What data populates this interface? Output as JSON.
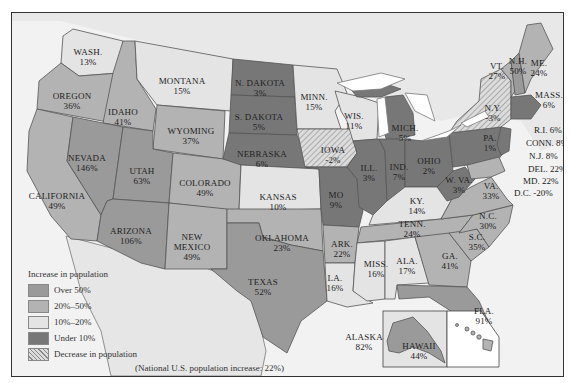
{
  "legend": {
    "title": "Increase in population",
    "items": [
      {
        "label": "Over 50%",
        "color": "#9a9a9a",
        "pattern": "solid"
      },
      {
        "label": "20%–50%",
        "color": "#b3b3b3",
        "pattern": "solid"
      },
      {
        "label": "10%–20%",
        "color": "#e4e4e4",
        "pattern": "solid"
      },
      {
        "label": "Under 10%",
        "color": "#777777",
        "pattern": "solid"
      },
      {
        "label": "Decrease in population",
        "color": "#d0d0d0",
        "pattern": "hatched"
      }
    ]
  },
  "note": "(National U.S. population increase: 22%)",
  "states": {
    "wash": {
      "name": "WASH.",
      "value": "13%"
    },
    "oregon": {
      "name": "OREGON",
      "value": "36%"
    },
    "california": {
      "name": "CALIFORNIA",
      "value": "49%"
    },
    "idaho": {
      "name": "IDAHO",
      "value": "41%"
    },
    "nevada": {
      "name": "NEVADA",
      "value": "146%"
    },
    "montana": {
      "name": "MONTANA",
      "value": "15%"
    },
    "wyoming": {
      "name": "WYOMING",
      "value": "37%"
    },
    "utah": {
      "name": "UTAH",
      "value": "63%"
    },
    "colorado": {
      "name": "COLORADO",
      "value": "49%"
    },
    "arizona": {
      "name": "ARIZONA",
      "value": "106%"
    },
    "new_mexico": {
      "name1": "NEW",
      "name2": "MEXICO",
      "value": "49%"
    },
    "n_dakota": {
      "name": "N. DAKOTA",
      "value": "3%"
    },
    "s_dakota": {
      "name": "S. DAKOTA",
      "value": "5%"
    },
    "nebraska": {
      "name": "NEBRASKA",
      "value": "6%"
    },
    "kansas": {
      "name": "KANSAS",
      "value": "10%"
    },
    "oklahoma": {
      "name": "OKLAHOMA",
      "value": "23%"
    },
    "texas": {
      "name": "TEXAS",
      "value": "52%"
    },
    "minn": {
      "name": "MINN.",
      "value": "15%"
    },
    "iowa": {
      "name": "IOWA",
      "value": "-2%"
    },
    "mo": {
      "name": "MO",
      "value": "9%"
    },
    "ark": {
      "name": "ARK.",
      "value": "22%"
    },
    "la": {
      "name": "LA.",
      "value": "16%"
    },
    "wis": {
      "name": "WIS.",
      "value": "11%"
    },
    "ill": {
      "name": "ILL.",
      "value": "3%"
    },
    "mich": {
      "name": "MICH.",
      "value": "5%"
    },
    "ind": {
      "name": "IND.",
      "value": "7%"
    },
    "ohio": {
      "name": "OHIO",
      "value": "2%"
    },
    "ky": {
      "name": "KY.",
      "value": "14%"
    },
    "tenn": {
      "name": "TENN.",
      "value": "24%"
    },
    "miss": {
      "name": "MISS.",
      "value": "16%"
    },
    "ala": {
      "name": "ALA.",
      "value": "17%"
    },
    "ga": {
      "name": "GA.",
      "value": "41%"
    },
    "fla": {
      "name": "FLA.",
      "value": "91%"
    },
    "sc": {
      "name": "S.C.",
      "value": "35%"
    },
    "nc": {
      "name": "N.C.",
      "value": "30%"
    },
    "va": {
      "name": "VA.",
      "value": "33%"
    },
    "wva": {
      "name": "W. VA.",
      "value": "3%"
    },
    "pa": {
      "name": "PA.",
      "value": "1%"
    },
    "ny": {
      "name": "N.Y.",
      "value": "-3%"
    },
    "vt": {
      "name": "VT.",
      "value": "27%"
    },
    "nh": {
      "name": "N.H.",
      "value": "50%"
    },
    "me": {
      "name": "ME.",
      "value": "24%"
    },
    "mass": {
      "name": "MASS.",
      "value": "6%"
    },
    "ri": {
      "label": "R.I. 6%"
    },
    "conn": {
      "label": "CONN. 8%"
    },
    "nj": {
      "label": "N.J. 8%"
    },
    "del": {
      "label": "DEL. 22%"
    },
    "md": {
      "label": "MD. 22%"
    },
    "dc": {
      "label": "D.C. -20%"
    },
    "alaska": {
      "name": "ALASKA",
      "value": "82%"
    },
    "hawaii": {
      "name": "HAWAII",
      "value": "44%"
    }
  }
}
